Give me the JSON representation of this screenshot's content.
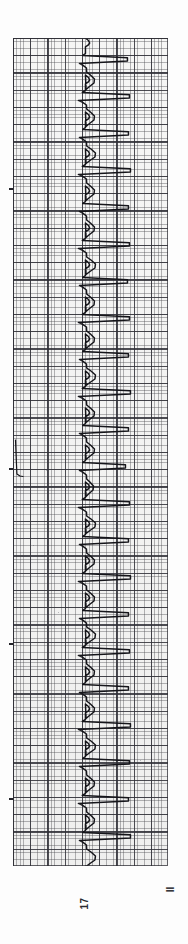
{
  "document": {
    "kind": "ecg-rhythm-strip",
    "orientation": "rotated-90-ccw",
    "page_number": "17",
    "lead_label": "II",
    "corner_mark": "25"
  },
  "paper": {
    "background_color": "#fbfbfa",
    "fine_grid_color": "#46464b",
    "bold_grid_color": "#282830",
    "trace_color": "#15151a",
    "fine_grid_mm_px": 3.45,
    "bold_grid_mm_px": 17.25,
    "left_px": 13,
    "top_px": 38,
    "width_px": 155,
    "height_px": 828
  },
  "chart_data": {
    "type": "line",
    "xlabel": "Amplitude (mV)",
    "ylabel": "Time (s)",
    "legend": [
      "II"
    ],
    "grid": true,
    "paper_speed_mm_per_s": 25,
    "gain_mm_per_mV": 10,
    "beat_count": 22,
    "baseline_x_mm": 21,
    "rr_interval_px": 37.0,
    "first_beat_y_px": 18,
    "beats": [
      {
        "index": 1,
        "r_peak_y_px": 22,
        "r_amp_px": 42,
        "s_amp_px": -6,
        "t_amp_px": 9
      },
      {
        "index": 2,
        "r_peak_y_px": 59,
        "r_amp_px": 44,
        "s_amp_px": -7,
        "t_amp_px": 9
      },
      {
        "index": 3,
        "r_peak_y_px": 96,
        "r_amp_px": 43,
        "s_amp_px": -6,
        "t_amp_px": 10
      },
      {
        "index": 4,
        "r_peak_y_px": 133,
        "r_amp_px": 45,
        "s_amp_px": -7,
        "t_amp_px": 9
      },
      {
        "index": 5,
        "r_peak_y_px": 170,
        "r_amp_px": 43,
        "s_amp_px": -6,
        "t_amp_px": 9
      },
      {
        "index": 6,
        "r_peak_y_px": 207,
        "r_amp_px": 44,
        "s_amp_px": -7,
        "t_amp_px": 10
      },
      {
        "index": 7,
        "r_peak_y_px": 244,
        "r_amp_px": 42,
        "s_amp_px": -6,
        "t_amp_px": 9
      },
      {
        "index": 8,
        "r_peak_y_px": 281,
        "r_amp_px": 44,
        "s_amp_px": -7,
        "t_amp_px": 9
      },
      {
        "index": 9,
        "r_peak_y_px": 318,
        "r_amp_px": 43,
        "s_amp_px": -6,
        "t_amp_px": 10
      },
      {
        "index": 10,
        "r_peak_y_px": 355,
        "r_amp_px": 45,
        "s_amp_px": -7,
        "t_amp_px": 9
      },
      {
        "index": 11,
        "r_peak_y_px": 392,
        "r_amp_px": 43,
        "s_amp_px": -6,
        "t_amp_px": 9
      },
      {
        "index": 12,
        "r_peak_y_px": 429,
        "r_amp_px": 40,
        "s_amp_px": -6,
        "t_amp_px": 8
      },
      {
        "index": 13,
        "r_peak_y_px": 466,
        "r_amp_px": 44,
        "s_amp_px": -7,
        "t_amp_px": 10
      },
      {
        "index": 14,
        "r_peak_y_px": 503,
        "r_amp_px": 43,
        "s_amp_px": -6,
        "t_amp_px": 9
      },
      {
        "index": 15,
        "r_peak_y_px": 540,
        "r_amp_px": 45,
        "s_amp_px": -7,
        "t_amp_px": 9
      },
      {
        "index": 16,
        "r_peak_y_px": 577,
        "r_amp_px": 43,
        "s_amp_px": -6,
        "t_amp_px": 10
      },
      {
        "index": 17,
        "r_peak_y_px": 614,
        "r_amp_px": 44,
        "s_amp_px": -7,
        "t_amp_px": 9
      },
      {
        "index": 18,
        "r_peak_y_px": 651,
        "r_amp_px": 43,
        "s_amp_px": -6,
        "t_amp_px": 9
      },
      {
        "index": 19,
        "r_peak_y_px": 688,
        "r_amp_px": 45,
        "s_amp_px": -7,
        "t_amp_px": 10
      },
      {
        "index": 20,
        "r_peak_y_px": 725,
        "r_amp_px": 44,
        "s_amp_px": -6,
        "t_amp_px": 9
      },
      {
        "index": 21,
        "r_peak_y_px": 762,
        "r_amp_px": 43,
        "s_amp_px": -7,
        "t_amp_px": 9
      },
      {
        "index": 22,
        "r_peak_y_px": 799,
        "r_amp_px": 45,
        "s_amp_px": -6,
        "t_amp_px": 10
      }
    ],
    "artifact": {
      "present": true,
      "description": "ink smudge / baseline deflection near left margin",
      "y_px": 430,
      "x_px": 14
    }
  },
  "edge_ticks": [
    {
      "y_px": 150
    },
    {
      "y_px": 430
    },
    {
      "y_px": 605
    },
    {
      "y_px": 760
    }
  ]
}
